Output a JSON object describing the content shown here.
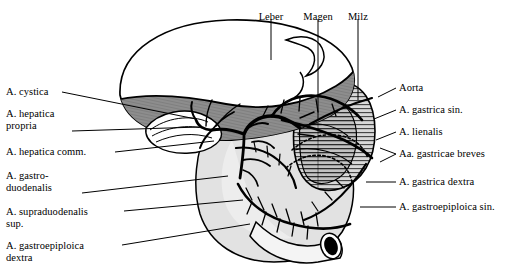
{
  "figure": {
    "palette": {
      "background": "#ffffff",
      "ink": "#000000",
      "liver_fill": "#8d8d8d",
      "liver_hatch": "#6f6f6f",
      "stomach_fill": "#e2e2e2",
      "spleen_fill": "#d2d2d2",
      "spleen_hatch": "#4a4a4a",
      "duodenum_fill": "#f2f2f2",
      "lumen": "#000000",
      "leader": "#000000",
      "white": "#ffffff"
    }
  },
  "labels": {
    "top": [
      {
        "id": "leber",
        "text": "Leber",
        "x": 271,
        "y": 11,
        "leader": {
          "x1": 271,
          "y1": 19,
          "x2": 271,
          "y2": 60
        }
      },
      {
        "id": "magen",
        "text": "Magen",
        "x": 318,
        "y": 11,
        "leader": {
          "x1": 318,
          "y1": 19,
          "x2": 318,
          "y2": 120
        }
      },
      {
        "id": "milz",
        "text": "Milz",
        "x": 358,
        "y": 11,
        "leader": {
          "x1": 358,
          "y1": 19,
          "x2": 358,
          "y2": 100
        }
      }
    ],
    "left": [
      {
        "id": "a-cystica",
        "text": "A. cystica",
        "x": 6,
        "y": 86,
        "leader": [
          [
            62,
            92
          ],
          [
            196,
            119
          ]
        ]
      },
      {
        "id": "a-hepatica-propria",
        "text": "A. hepatica\npropria",
        "x": 6,
        "y": 108,
        "leader": [
          [
            72,
            131
          ],
          [
            200,
            127
          ]
        ]
      },
      {
        "id": "a-hepatica-comm",
        "text": "A. hepatica comm.",
        "x": 6,
        "y": 146,
        "leader": [
          [
            115,
            152
          ],
          [
            214,
            141
          ]
        ]
      },
      {
        "id": "a-gastroduodenalis",
        "text": "A. gastro-\nduodenalis",
        "x": 6,
        "y": 170,
        "leader": [
          [
            82,
            193
          ],
          [
            228,
            176
          ]
        ]
      },
      {
        "id": "a-supraduodenalis-sup",
        "text": "A. supraduodenalis\nsup.",
        "x": 6,
        "y": 206,
        "leader": [
          [
            124,
            211
          ],
          [
            243,
            200
          ]
        ]
      },
      {
        "id": "a-gastroepiploica-dextra",
        "text": "A. gastroepiploica\ndextra",
        "x": 6,
        "y": 240,
        "leader": [
          [
            122,
            245
          ],
          [
            250,
            224
          ]
        ]
      }
    ],
    "right": [
      {
        "id": "aorta",
        "text": "Aorta",
        "x": 399,
        "y": 82,
        "leader": [
          [
            396,
            88
          ],
          [
            378,
            97
          ]
        ]
      },
      {
        "id": "a-gastrica-sin",
        "text": "A. gastrica sin.",
        "x": 399,
        "y": 104,
        "leader": [
          [
            396,
            110
          ],
          [
            374,
            119
          ]
        ]
      },
      {
        "id": "a-lienalis",
        "text": "A. lienalis",
        "x": 399,
        "y": 126,
        "leader": [
          [
            396,
            132
          ],
          [
            376,
            140
          ]
        ]
      },
      {
        "id": "aa-gastricae-breves",
        "text": "Aa. gastricae breves",
        "x": 399,
        "y": 148,
        "leader": [
          [
            396,
            154
          ],
          [
            380,
            148
          ]
        ],
        "leader2": [
          [
            396,
            154
          ],
          [
            380,
            162
          ]
        ]
      },
      {
        "id": "a-gastrica-dextra",
        "text": "A. gastrica dextra",
        "x": 399,
        "y": 176,
        "leader": [
          [
            396,
            182
          ],
          [
            366,
            182
          ]
        ]
      },
      {
        "id": "a-gastroepiploica-sin",
        "text": "A. gastroepiploica sin.",
        "x": 399,
        "y": 201,
        "leader": [
          [
            396,
            207
          ],
          [
            360,
            207
          ]
        ]
      }
    ]
  }
}
